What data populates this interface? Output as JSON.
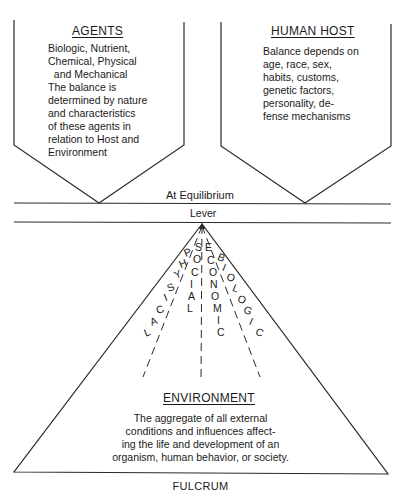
{
  "agents": {
    "title": "AGENTS",
    "lines": [
      "Biologic, Nutrient,",
      "Chemical, Physical",
      "  and Mechanical",
      "The balance is",
      "determined by nature",
      "and characteristics",
      "of these agents in",
      "relation to Host and",
      "Environment"
    ]
  },
  "host": {
    "title": "HUMAN HOST",
    "lines": [
      "Balance depends on",
      "age, race, sex,",
      "habits, customs,",
      "genetic factors,",
      "personality, de-",
      "fense mechanisms"
    ]
  },
  "equilibrium_label": "At Equilibrium",
  "lever_label": "Lever",
  "fan_labels": {
    "physical": [
      "P",
      "H",
      "Y",
      "S",
      "I",
      "C",
      "A",
      "L"
    ],
    "social": [
      "S",
      "O",
      "C",
      "I",
      "A",
      "L"
    ],
    "economic": [
      "E",
      "C",
      "O",
      "N",
      "O",
      "M",
      "I",
      "C"
    ],
    "biologic": [
      "B",
      "I",
      "O",
      "L",
      "O",
      "G",
      "I",
      "C"
    ]
  },
  "environment": {
    "title": "ENVIRONMENT",
    "lines": [
      "The aggregate of all external",
      "conditions and influences affect-",
      "ing the life and development of an",
      "organism, human behavior, or society."
    ]
  },
  "fulcrum_label": "FULCRUM",
  "colors": {
    "line": "#2a2a2a",
    "text": "#1a1a1a",
    "background": "#ffffff"
  }
}
